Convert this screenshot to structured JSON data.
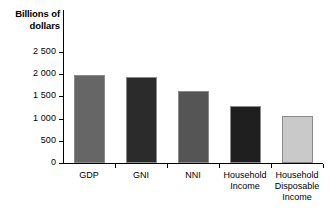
{
  "chart_data": {
    "type": "bar",
    "title": "",
    "ylabel": "Billions of\ndollars",
    "ylabel_line1": "Billions of",
    "ylabel_line2": "dollars",
    "xlabel": "",
    "ylim": [
      0,
      2500
    ],
    "grid": false,
    "legend": "none",
    "ytick_labels": [
      "0",
      "500",
      "1 000",
      "1 500",
      "2 000",
      "2 500"
    ],
    "ytick_values": [
      0,
      500,
      1000,
      1500,
      2000,
      2500
    ],
    "categories": [
      "GDP",
      "GNI",
      "NNI",
      "Household Income",
      "Household Disposable Income"
    ],
    "category_lines": [
      [
        "GDP"
      ],
      [
        "GNI"
      ],
      [
        "NNI"
      ],
      [
        "Household",
        "Income"
      ],
      [
        "Household",
        "Disposable",
        "Income"
      ]
    ],
    "values": [
      1980,
      1940,
      1620,
      1280,
      1050
    ],
    "bar_colors": [
      "#666666",
      "#2b2b2b",
      "#555555",
      "#1f1f1f",
      "#c9c9c9"
    ],
    "bar_border_color": "#8a8a8a"
  }
}
